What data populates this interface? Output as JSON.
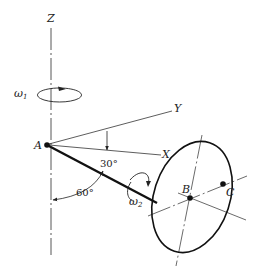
{
  "diagram": {
    "axes": {
      "z_label": "Z",
      "y_label": "Y",
      "x_label": "X"
    },
    "points": {
      "a_label": "A",
      "b_label": "B",
      "c_label": "C"
    },
    "angles": {
      "angle_rod_x": "30°",
      "angle_rod_z": "60°"
    },
    "angular_velocities": {
      "omega1_symbol": "ω",
      "omega1_subscript": "1",
      "omega2_symbol": "ω",
      "omega2_subscript": "2"
    },
    "colors": {
      "line": "#222222",
      "background": "#ffffff"
    }
  }
}
